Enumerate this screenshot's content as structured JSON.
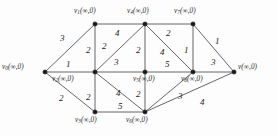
{
  "figure": {
    "type": "weighted-undirected-graph",
    "vertex_state_label": "(∞,0)",
    "infinity_symbol": "∞",
    "initial_value": "0"
  },
  "nodes": [
    {
      "id": "v0",
      "name": "v",
      "sub": "0",
      "state": "(∞,0)",
      "x": 45,
      "y": 72,
      "label_x": 2,
      "label_y": 64,
      "label_align": "left"
    },
    {
      "id": "v1",
      "name": "v",
      "sub": "1",
      "state": "(∞,0)",
      "x": 95,
      "y": 24,
      "label_x": 74,
      "label_y": 8,
      "label_align": "left"
    },
    {
      "id": "v2",
      "name": "v",
      "sub": "2",
      "state": "(∞,0)",
      "x": 95,
      "y": 72,
      "label_x": 52,
      "label_y": 76,
      "label_align": "left"
    },
    {
      "id": "v3",
      "name": "v",
      "sub": "3",
      "state": "(∞,0)",
      "x": 95,
      "y": 112,
      "label_x": 75,
      "label_y": 117,
      "label_align": "left"
    },
    {
      "id": "v4",
      "name": "v",
      "sub": "4",
      "state": "(∞,0)",
      "x": 145,
      "y": 24,
      "label_x": 127,
      "label_y": 8,
      "label_align": "left"
    },
    {
      "id": "v5",
      "name": "v",
      "sub": "5",
      "state": "(∞,0)",
      "x": 145,
      "y": 72,
      "label_x": 133,
      "label_y": 76,
      "label_align": "left"
    },
    {
      "id": "v6",
      "name": "v",
      "sub": "6",
      "state": "(∞,0)",
      "x": 145,
      "y": 112,
      "label_x": 126,
      "label_y": 117,
      "label_align": "left"
    },
    {
      "id": "v7",
      "name": "v",
      "sub": "7",
      "state": "(∞,0)",
      "x": 193,
      "y": 24,
      "label_x": 174,
      "label_y": 8,
      "label_align": "left"
    },
    {
      "id": "v8",
      "name": "v",
      "sub": "8",
      "state": "(∞,0)",
      "x": 193,
      "y": 72,
      "label_x": 181,
      "label_y": 76,
      "label_align": "left"
    },
    {
      "id": "v",
      "name": "v",
      "sub": "",
      "state": "(∞,0)",
      "x": 234,
      "y": 72,
      "label_x": 238,
      "label_y": 64,
      "label_align": "left"
    }
  ],
  "edges": [
    {
      "from": "v0",
      "to": "v1",
      "weight": "3",
      "wx": 60,
      "wy": 34
    },
    {
      "from": "v0",
      "to": "v2",
      "weight": "1",
      "wx": 66,
      "wy": 60
    },
    {
      "from": "v0",
      "to": "v3",
      "weight": "2",
      "wx": 59,
      "wy": 94
    },
    {
      "from": "v1",
      "to": "v2",
      "weight": "2",
      "wx": 86,
      "wy": 46
    },
    {
      "from": "v1",
      "to": "v4",
      "weight": "4",
      "wx": 115,
      "wy": 29
    },
    {
      "from": "v2",
      "to": "v1",
      "weight": "2",
      "wx": 102,
      "wy": 42,
      "diagonal_note": "label along v2-v4 upper"
    },
    {
      "from": "v2",
      "to": "v4",
      "weight": "3",
      "wx": 114,
      "wy": 58
    },
    {
      "from": "v2",
      "to": "v3",
      "weight": "2",
      "wx": 86,
      "wy": 93
    },
    {
      "from": "v2",
      "to": "v5",
      "weight": "5",
      "wx": 0,
      "wy": 0,
      "hidden": true
    },
    {
      "from": "v2",
      "to": "v6",
      "weight": "4",
      "wx": 116,
      "wy": 89
    },
    {
      "from": "v3",
      "to": "v6",
      "weight": "5",
      "wx": 118,
      "wy": 102
    },
    {
      "from": "v4",
      "to": "v5",
      "weight": "2",
      "wx": 136,
      "wy": 46
    },
    {
      "from": "v4",
      "to": "v7",
      "weight": "2",
      "wx": 166,
      "wy": 29
    },
    {
      "from": "v4",
      "to": "v8",
      "weight": "4",
      "wx": 160,
      "wy": 48
    },
    {
      "from": "v5",
      "to": "v8",
      "weight": "5",
      "wx": 165,
      "wy": 60
    },
    {
      "from": "v5",
      "to": "v6",
      "weight": "2",
      "wx": 136,
      "wy": 90
    },
    {
      "from": "v6",
      "to": "v8",
      "weight": "3",
      "wx": 178,
      "wy": 92
    },
    {
      "from": "v6",
      "to": "v",
      "weight": "4",
      "wx": 200,
      "wy": 98
    },
    {
      "from": "v7",
      "to": "v8",
      "weight": "1",
      "wx": 184,
      "wy": 46
    },
    {
      "from": "v7",
      "to": "v",
      "weight": "1",
      "wx": 215,
      "wy": 37
    },
    {
      "from": "v8",
      "to": "v",
      "weight": "3",
      "wx": 211,
      "wy": 58
    }
  ],
  "edge_paths": [
    {
      "from": "v0",
      "to": "v1"
    },
    {
      "from": "v0",
      "to": "v2"
    },
    {
      "from": "v0",
      "to": "v3"
    },
    {
      "from": "v1",
      "to": "v2"
    },
    {
      "from": "v1",
      "to": "v4"
    },
    {
      "from": "v2",
      "to": "v4"
    },
    {
      "from": "v2",
      "to": "v3"
    },
    {
      "from": "v2",
      "to": "v5"
    },
    {
      "from": "v2",
      "to": "v6"
    },
    {
      "from": "v3",
      "to": "v6"
    },
    {
      "from": "v4",
      "to": "v5"
    },
    {
      "from": "v4",
      "to": "v7"
    },
    {
      "from": "v4",
      "to": "v8"
    },
    {
      "from": "v5",
      "to": "v8"
    },
    {
      "from": "v5",
      "to": "v6"
    },
    {
      "from": "v6",
      "to": "v8"
    },
    {
      "from": "v6",
      "to": "v"
    },
    {
      "from": "v7",
      "to": "v8"
    },
    {
      "from": "v7",
      "to": "v"
    },
    {
      "from": "v8",
      "to": "v"
    }
  ]
}
